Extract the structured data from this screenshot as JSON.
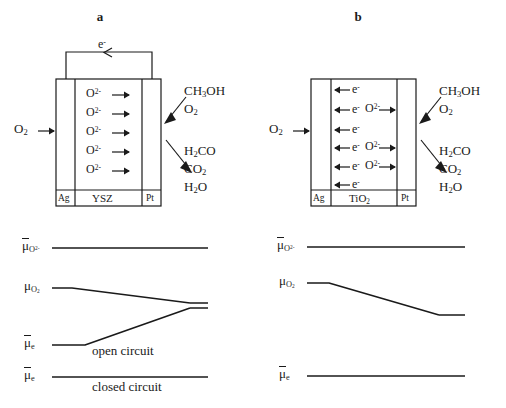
{
  "figure": {
    "type": "diagram"
  },
  "panels": [
    {
      "id": "a",
      "label": "a",
      "cell": {
        "electrode_left": "Ag",
        "electrolyte": "YSZ",
        "electrode_right": "Pt",
        "external_circuit": {
          "carrier": "e",
          "charge": "-",
          "direction": "left"
        },
        "inlet_left": {
          "species": "O",
          "sub": "2",
          "direction": "right"
        },
        "migrating_species": {
          "species": "O",
          "sup": "2-",
          "direction": "right",
          "count": 5
        },
        "feed_in": [
          "CH3OH",
          "O2"
        ],
        "feed_in_display": [
          {
            "pre": "CH",
            "sub": "3",
            "post": "OH"
          },
          {
            "pre": "O",
            "sub": "2",
            "post": ""
          }
        ],
        "products_out": [
          "H2CO",
          "CO2",
          "H2O"
        ],
        "products_out_display": [
          {
            "pre": "H",
            "sub": "2",
            "post": "CO"
          },
          {
            "pre": "CO",
            "sub": "2",
            "post": ""
          },
          {
            "pre": "H",
            "sub": "2",
            "post": "O"
          }
        ]
      },
      "potential_diagram": {
        "traces": [
          {
            "name": "mu-bar-O2minus",
            "symbol": "μ",
            "overbar": true,
            "sup": "2-",
            "sub": "O",
            "shape": "flat",
            "note": "constant oxygen ion electrochemical potential"
          },
          {
            "name": "mu-O2",
            "symbol": "μ",
            "overbar": false,
            "sub": "O2",
            "shape": "descending",
            "note": "oxygen chemical potential drops across cell"
          },
          {
            "name": "mu-bar-e-open",
            "symbol": "μ",
            "overbar": true,
            "sub": "e",
            "shape": "ascending",
            "note": "electron electrochemical potential rises"
          },
          {
            "name": "mu-bar-e-closed",
            "symbol": "μ",
            "overbar": true,
            "sub": "e",
            "shape": "flat",
            "note": "electron electrochemical potential flat"
          }
        ],
        "captions": [
          "open circuit",
          "closed circuit"
        ]
      }
    },
    {
      "id": "b",
      "label": "b",
      "cell": {
        "electrode_left": "Ag",
        "electrolyte": "TiO",
        "electrolyte_sub": "2",
        "electrode_right": "Pt",
        "external_circuit": null,
        "inlet_left": {
          "species": "O",
          "sub": "2",
          "direction": "right"
        },
        "electron_flux": {
          "species": "e",
          "sup": "-",
          "direction": "left",
          "count": 6
        },
        "migrating_species": {
          "species": "O",
          "sup": "2-",
          "direction": "right",
          "count": 3
        },
        "feed_in_display": [
          {
            "pre": "CH",
            "sub": "3",
            "post": "OH"
          },
          {
            "pre": "O",
            "sub": "2",
            "post": ""
          }
        ],
        "products_out_display": [
          {
            "pre": "H",
            "sub": "2",
            "post": "CO"
          },
          {
            "pre": "CO",
            "sub": "2",
            "post": ""
          },
          {
            "pre": "H",
            "sub": "2",
            "post": "O"
          }
        ]
      },
      "potential_diagram": {
        "traces": [
          {
            "name": "mu-bar-O2minus",
            "symbol": "μ",
            "overbar": true,
            "sup": "2-",
            "sub": "O",
            "shape": "flat"
          },
          {
            "name": "mu-O2",
            "symbol": "μ",
            "overbar": false,
            "sub": "O2",
            "shape": "descending"
          },
          {
            "name": "mu-bar-e",
            "symbol": "μ",
            "overbar": true,
            "sub": "e",
            "shape": "flat"
          }
        ],
        "captions": []
      }
    }
  ],
  "text": {
    "a_label": "a",
    "b_label": "b",
    "ag": "Ag",
    "pt": "Pt",
    "ysz": "YSZ",
    "tio": "TiO",
    "tio_sub": "2",
    "open_circuit": "open circuit",
    "closed_circuit": "closed circuit",
    "mu_letter": "μ",
    "e_letter": "e",
    "o_letter": "O",
    "minus": "−",
    "charge_2minus": "2-",
    "charge_minus": "-",
    "sub_2": "2",
    "sub_3": "3",
    "sub_e": "e",
    "ch3oh_pre": "CH",
    "ch3oh_post": "OH",
    "h2co_pre": "H",
    "h2co_post": "CO",
    "co2_pre": "CO",
    "h2o_pre": "H",
    "h2o_post": "O"
  },
  "colors": {
    "stroke": "#1a1a1a",
    "background": "#ffffff",
    "text": "#1a1a1a"
  }
}
